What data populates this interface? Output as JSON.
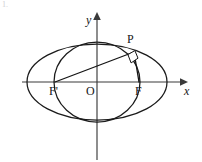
{
  "figure": {
    "corner_marker": "1.",
    "axes": {
      "x_label": "x",
      "y_label": "y",
      "origin_label": "O"
    },
    "points": [
      {
        "id": "focus-left",
        "label": "F'",
        "x": 55,
        "y": 82
      },
      {
        "id": "origin",
        "label": "O",
        "x": 97,
        "y": 82
      },
      {
        "id": "focus-right",
        "label": "F",
        "x": 139,
        "y": 82
      },
      {
        "id": "point-p",
        "label": "P",
        "x": 134,
        "y": 52
      }
    ],
    "curves": [
      {
        "id": "outer-ellipse",
        "type": "ellipse",
        "cx": 97,
        "cy": 82,
        "rx": 70,
        "ry": 38
      },
      {
        "id": "inner-circle",
        "type": "ellipse",
        "cx": 97,
        "cy": 82,
        "rx": 43,
        "ry": 40
      }
    ],
    "segments": [
      {
        "id": "segment-f-prime-p",
        "from": "focus-left",
        "to": "point-p"
      },
      {
        "id": "segment-f-p",
        "from": "focus-right",
        "to": "point-p"
      }
    ],
    "angle_marks": [
      {
        "id": "right-angle-at-p",
        "vertex": "point-p",
        "symbol": "right-angle",
        "degrees": 90
      }
    ],
    "colors": {
      "curve_stroke": "#1b1b1b",
      "axis_stroke": "#3a3a3a",
      "segment_stroke": "#141414",
      "label_fill": "#161616",
      "background": "#ffffff",
      "corner_marker": "#cfcfd4"
    }
  }
}
